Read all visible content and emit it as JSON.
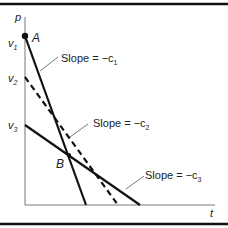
{
  "axes": {
    "y_label": "p",
    "x_label": "t"
  },
  "ticks": {
    "v1": "v",
    "v1_sub": "1",
    "v2": "v",
    "v2_sub": "2",
    "v3": "v",
    "v3_sub": "3"
  },
  "points": {
    "A": "A",
    "B": "B"
  },
  "annotations": {
    "slope1_text": "Slope = −c",
    "slope1_sub": "1",
    "slope2_text": "Slope = −c",
    "slope2_sub": "2",
    "slope3_text": "Slope = −c",
    "slope3_sub": "3"
  },
  "colors": {
    "line": "#111111",
    "leader": "#555555",
    "axis": "#777777"
  }
}
